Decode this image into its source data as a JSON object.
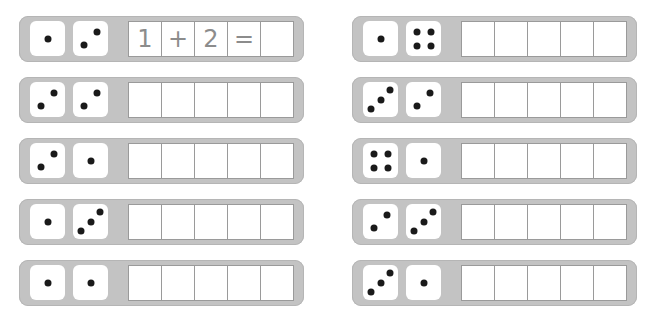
{
  "worksheet": {
    "left_column": [
      {
        "die1": 1,
        "die2": 2,
        "cells": [
          "1",
          "+",
          "2",
          "=",
          ""
        ]
      },
      {
        "die1": 2,
        "die2": 2,
        "cells": [
          "",
          "",
          "",
          "",
          ""
        ]
      },
      {
        "die1": 2,
        "die2": 1,
        "cells": [
          "",
          "",
          "",
          "",
          ""
        ]
      },
      {
        "die1": 1,
        "die2": 3,
        "cells": [
          "",
          "",
          "",
          "",
          ""
        ]
      },
      {
        "die1": 1,
        "die2": 1,
        "cells": [
          "",
          "",
          "",
          "",
          ""
        ]
      }
    ],
    "right_column": [
      {
        "die1": 1,
        "die2": 4,
        "cells": [
          "",
          "",
          "",
          "",
          ""
        ]
      },
      {
        "die1": 3,
        "die2": 2,
        "cells": [
          "",
          "",
          "",
          "",
          ""
        ]
      },
      {
        "die1": 4,
        "die2": 1,
        "cells": [
          "",
          "",
          "",
          "",
          ""
        ]
      },
      {
        "die1": 2,
        "die2": 3,
        "cells": [
          "",
          "",
          "",
          "",
          ""
        ]
      },
      {
        "die1": 3,
        "die2": 1,
        "cells": [
          "",
          "",
          "",
          "",
          ""
        ]
      }
    ]
  },
  "colors": {
    "strip": "#c3c3c3",
    "die": "#ffffff",
    "pip": "#1a1a1a",
    "box_border": "#9a9a9a",
    "digit": "#8c8c8c"
  }
}
